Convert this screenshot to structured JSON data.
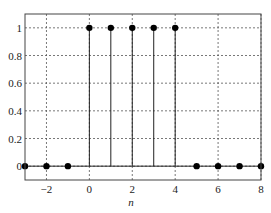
{
  "chart_data": {
    "type": "stem",
    "title": "",
    "xlabel": "n",
    "ylabel": "",
    "xlim": [
      -3,
      8
    ],
    "ylim": [
      -0.1,
      1.1
    ],
    "grid": true,
    "legend": null,
    "x": [
      -3,
      -2,
      -1,
      0,
      1,
      2,
      3,
      4,
      5,
      6,
      7,
      8
    ],
    "values": [
      0,
      0,
      0,
      1,
      1,
      1,
      1,
      1,
      0,
      0,
      0,
      0
    ],
    "xticks": [
      -2,
      0,
      2,
      4,
      6,
      8
    ],
    "xtick_labels": [
      "−2",
      "0",
      "2",
      "4",
      "6",
      "8"
    ],
    "yticks": [
      0,
      0.2,
      0.4,
      0.6,
      0.8,
      1
    ],
    "ytick_labels": [
      "0",
      "0.2",
      "0.4",
      "0.6",
      "0.8",
      "1"
    ],
    "colors": {
      "stem": "#222222",
      "marker": "#000000",
      "grid": "#555555",
      "frame": "#444444"
    }
  }
}
